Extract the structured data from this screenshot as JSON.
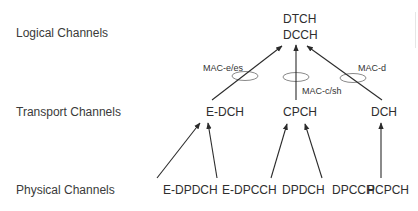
{
  "rows": {
    "logical": "Logical Channels",
    "transport": "Transport Channels",
    "physical": "Physical Channels"
  },
  "logical_nodes": {
    "line1": "DTCH",
    "line2": "DCCH"
  },
  "transport_nodes": [
    {
      "label": "E-DCH"
    },
    {
      "label": "CPCH"
    },
    {
      "label": "DCH"
    }
  ],
  "physical_nodes": [
    {
      "label": "E-DPDCH"
    },
    {
      "label": "E-DPCCH"
    },
    {
      "label": "DPDCH"
    },
    {
      "label": "DPCCH"
    },
    {
      "label": "PCPCH"
    }
  ],
  "mac_entities": [
    {
      "label": "MAC-e/es"
    },
    {
      "label": "MAC-c/sh"
    },
    {
      "label": "MAC-d"
    }
  ],
  "colors": {
    "line": "#2b2b2b",
    "ellipse": "#8a8a8a",
    "text": "#333333"
  }
}
